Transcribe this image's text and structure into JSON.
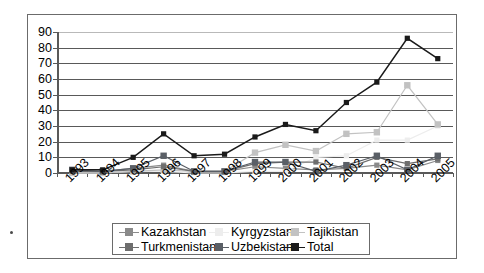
{
  "figure": {
    "background": "#ffffff",
    "frame_color": "#6b6b6b",
    "axis_color": "#595959",
    "gridline_color": "#595959"
  },
  "chart_data": {
    "type": "line",
    "title": "",
    "subtitle": "",
    "xlabel": "",
    "ylabel": "",
    "x": [
      "1993",
      "1994",
      "1995",
      "1996",
      "1997",
      "1998",
      "1999",
      "2000",
      "2001",
      "2002",
      "2003",
      "2004",
      "2005"
    ],
    "categories": [
      "1993",
      "1994",
      "1995",
      "1996",
      "1997",
      "1998",
      "1999",
      "2000",
      "2001",
      "2002",
      "2003",
      "2004",
      "2005"
    ],
    "ylim": [
      0,
      90
    ],
    "yticks": [
      0,
      10,
      20,
      30,
      40,
      50,
      60,
      70,
      80,
      90
    ],
    "ytick_labels": [
      "0",
      "10",
      "20",
      "30",
      "40",
      "50",
      "60",
      "70",
      "80",
      "90"
    ],
    "grid": "horizontal",
    "legend_position": "bottom",
    "legend_columns": 3,
    "markers": "square",
    "series": [
      {
        "name": "Kazakhstan",
        "color": "#8a8a8a",
        "values": [
          0,
          1,
          3,
          5,
          1,
          1,
          4,
          3,
          2,
          3,
          5,
          2,
          8
        ]
      },
      {
        "name": "Kyrgyzstan",
        "color": "#ededed",
        "values": [
          0,
          0,
          1,
          1,
          0,
          0,
          1,
          1,
          10,
          11,
          21,
          21,
          30
        ]
      },
      {
        "name": "Tajikistan",
        "color": "#c2c2c2",
        "values": [
          0,
          0,
          1,
          2,
          1,
          1,
          13,
          18,
          14,
          25,
          26,
          56,
          31
        ]
      },
      {
        "name": "Turkmenistan",
        "color": "#6e6e6e",
        "values": [
          1,
          1,
          2,
          4,
          1,
          1,
          6,
          7,
          7,
          3,
          10,
          6,
          9
        ]
      },
      {
        "name": "Uzbekistan",
        "color": "#5a5f66",
        "values": [
          2,
          1,
          3,
          11,
          1,
          1,
          7,
          7,
          1,
          5,
          11,
          2,
          11
        ]
      },
      {
        "name": "Total",
        "color": "#1a1a1a",
        "values": [
          2,
          2,
          10,
          25,
          11,
          12,
          23,
          31,
          27,
          45,
          58,
          86,
          73
        ]
      }
    ]
  },
  "legend": {
    "entries": [
      {
        "label": "Kazakhstan",
        "color": "#8a8a8a"
      },
      {
        "label": "Kyrgyzstan",
        "color": "#ededed"
      },
      {
        "label": "Tajikistan",
        "color": "#c2c2c2"
      },
      {
        "label": "Turkmenistan",
        "color": "#6e6e6e"
      },
      {
        "label": "Uzbekistan",
        "color": "#5a5f66"
      },
      {
        "label": "Total",
        "color": "#1a1a1a"
      }
    ]
  }
}
